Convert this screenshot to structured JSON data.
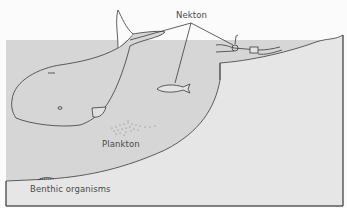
{
  "diagram": {
    "type": "marine-zones-illustration",
    "labels": {
      "nekton": "Nekton",
      "plankton": "Plankton",
      "benthic": "Benthic organisms"
    },
    "nekton_examples": [
      "whale",
      "fish",
      "scuba-diver"
    ],
    "colors": {
      "sky": "#fbfbfb",
      "water": "#d6d6d6",
      "land": "#e6e6e6",
      "line": "#3a3a3a",
      "text": "#4a4a4a"
    }
  }
}
